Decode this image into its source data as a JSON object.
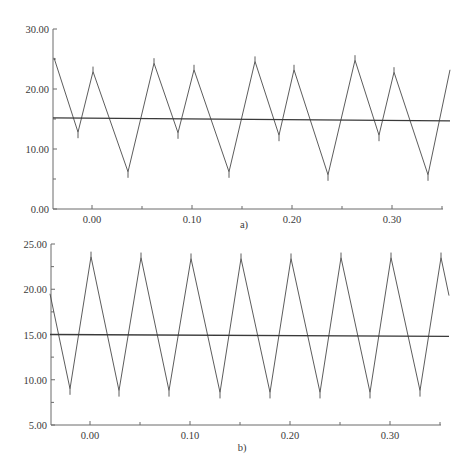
{
  "chart_data": [
    {
      "type": "line",
      "panel_label": "a)",
      "title": "",
      "xlabel": "",
      "ylabel": "",
      "xlim": [
        -0.039,
        0.351
      ],
      "ylim": [
        0,
        30
      ],
      "x_ticks": [
        0.0,
        0.1,
        0.2,
        0.3
      ],
      "x_tick_labels": [
        "0.00",
        "0.10",
        "0.20",
        "0.30"
      ],
      "y_ticks": [
        0,
        10,
        20,
        30
      ],
      "y_tick_labels": [
        "0.00",
        "10.00",
        "20.00",
        "30.00"
      ],
      "grid": false,
      "legend": null,
      "series": [
        {
          "name": "triangular waveform",
          "x": [
            -0.038,
            -0.014,
            0.001,
            0.036,
            0.062,
            0.086,
            0.102,
            0.137,
            0.163,
            0.187,
            0.202,
            0.236,
            0.263,
            0.287,
            0.302,
            0.336,
            0.358
          ],
          "y": [
            25.2,
            12.8,
            22.9,
            6.2,
            24.3,
            12.7,
            23.2,
            6.2,
            24.6,
            12.3,
            23.2,
            5.7,
            24.8,
            12.3,
            22.8,
            5.7,
            23.2
          ]
        },
        {
          "name": "mean level",
          "x": [
            -0.039,
            0.358
          ],
          "y": [
            15.2,
            14.7
          ]
        }
      ]
    },
    {
      "type": "line",
      "panel_label": "b)",
      "title": "",
      "xlabel": "",
      "ylabel": "",
      "xlim": [
        -0.04,
        0.35
      ],
      "ylim": [
        5,
        25
      ],
      "x_ticks": [
        0.0,
        0.1,
        0.2,
        0.3
      ],
      "x_tick_labels": [
        "0.00",
        "0.10",
        "0.20",
        "0.30"
      ],
      "y_ticks": [
        5,
        10,
        15,
        20,
        25
      ],
      "y_tick_labels": [
        "5.00",
        "10.00",
        "15.00",
        "20.00",
        "25.00"
      ],
      "grid": false,
      "legend": null,
      "series": [
        {
          "name": "triangular waveform",
          "x": [
            -0.04,
            -0.02,
            0.001,
            0.029,
            0.051,
            0.079,
            0.101,
            0.13,
            0.151,
            0.18,
            0.201,
            0.23,
            0.251,
            0.28,
            0.301,
            0.33,
            0.351,
            0.359
          ],
          "y": [
            19.5,
            9.0,
            23.6,
            8.8,
            23.5,
            8.8,
            23.4,
            8.6,
            23.4,
            8.6,
            23.4,
            8.6,
            23.5,
            8.6,
            23.5,
            8.8,
            23.5,
            19.3
          ]
        },
        {
          "name": "mean level",
          "x": [
            -0.04,
            0.359
          ],
          "y": [
            15.0,
            14.8
          ]
        }
      ]
    }
  ]
}
